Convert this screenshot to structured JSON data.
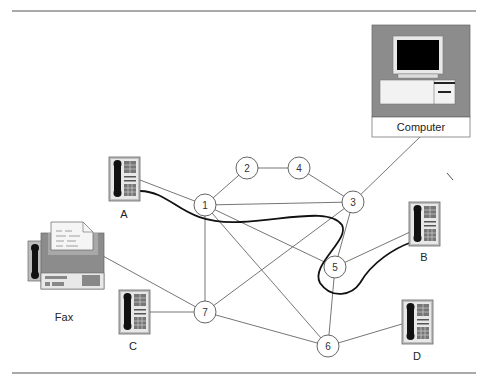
{
  "diagram": {
    "type": "circuit-switched network",
    "nodes": [
      {
        "id": "1",
        "x": 205,
        "y": 205
      },
      {
        "id": "2",
        "x": 247,
        "y": 168
      },
      {
        "id": "3",
        "x": 353,
        "y": 202
      },
      {
        "id": "4",
        "x": 299,
        "y": 168
      },
      {
        "id": "5",
        "x": 335,
        "y": 267
      },
      {
        "id": "6",
        "x": 328,
        "y": 346
      },
      {
        "id": "7",
        "x": 205,
        "y": 312
      }
    ],
    "devices": {
      "computer": {
        "label": "Computer"
      },
      "fax": {
        "label": "Fax"
      },
      "phone_a": {
        "label": "A"
      },
      "phone_b": {
        "label": "B"
      },
      "phone_c": {
        "label": "C"
      },
      "phone_d": {
        "label": "D"
      }
    },
    "links": [
      [
        "1",
        "2"
      ],
      [
        "2",
        "4"
      ],
      [
        "4",
        "3"
      ],
      [
        "1",
        "3"
      ],
      [
        "1",
        "5"
      ],
      [
        "1",
        "6"
      ],
      [
        "1",
        "7"
      ],
      [
        "3",
        "5"
      ],
      [
        "3",
        "7"
      ],
      [
        "5",
        "6"
      ],
      [
        "7",
        "6"
      ],
      [
        "A",
        "1"
      ],
      [
        "B",
        "5"
      ],
      [
        "C",
        "7"
      ],
      [
        "D",
        "6"
      ],
      [
        "Fax",
        "7"
      ],
      [
        "Computer",
        "3"
      ]
    ],
    "highlighted_path": {
      "from": "A",
      "to": "B",
      "via": [
        "1",
        "5"
      ]
    }
  },
  "colors": {
    "line": "#666666",
    "path": "#111111",
    "device_bg": "#8c8c8c",
    "screen": "#000000"
  }
}
